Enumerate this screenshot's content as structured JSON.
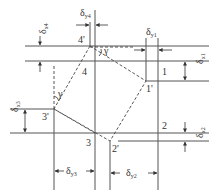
{
  "diagram": {
    "points": [
      {
        "id": "1",
        "label": "1"
      },
      {
        "id": "1p",
        "label": "1'"
      },
      {
        "id": "2",
        "label": "2"
      },
      {
        "id": "2p",
        "label": "2'"
      },
      {
        "id": "3",
        "label": "3"
      },
      {
        "id": "3p",
        "label": "3'"
      },
      {
        "id": "4",
        "label": "4"
      },
      {
        "id": "4p",
        "label": "4'"
      }
    ],
    "angle_label": "γ",
    "dimensions": {
      "dx4": {
        "sym": "δ",
        "sub": "x4"
      },
      "dy4": {
        "sym": "δ",
        "sub": "y4"
      },
      "dy1": {
        "sym": "δ",
        "sub": "y1"
      },
      "dx1": {
        "sym": "δ",
        "sub": "x1"
      },
      "dx3": {
        "sym": "δ",
        "sub": "x3"
      },
      "dx2": {
        "sym": "δ",
        "sub": "x2"
      },
      "dy3": {
        "sym": "δ",
        "sub": "y3"
      },
      "dy2": {
        "sym": "δ",
        "sub": "y2"
      }
    }
  }
}
